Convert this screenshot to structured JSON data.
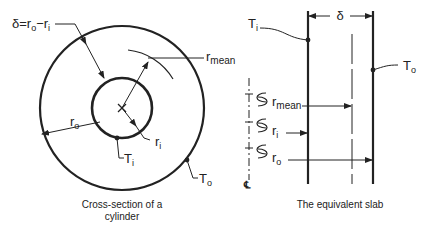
{
  "cylinder": {
    "delta_label": "δ=r",
    "delta_sub_o": "o",
    "delta_minus": "−r",
    "delta_sub_i": "i",
    "r_mean_base": "r",
    "r_mean_sub": "mean",
    "r_o_base": "r",
    "r_o_sub": "o",
    "r_i_base": "r",
    "r_i_sub": "i",
    "T_i_base": "T",
    "T_i_sub": "i",
    "T_o_base": "T",
    "T_o_sub": "o",
    "caption_line1": "Cross-section of a",
    "caption_line2": "cylinder"
  },
  "slab": {
    "delta_label": "δ",
    "T_i_base": "T",
    "T_i_sub": "i",
    "T_o_base": "T",
    "T_o_sub": "o",
    "r_mean_base": "r",
    "r_mean_sub": "mean",
    "r_i_base": "r",
    "r_i_sub": "i",
    "r_o_base": "r",
    "r_o_sub": "o",
    "centerline_symbol": "℄",
    "caption": "The equivalent slab"
  }
}
